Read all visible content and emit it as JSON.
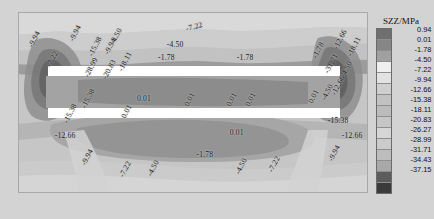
{
  "figure": {
    "type": "contour",
    "quantity": "SZZ",
    "units": "MPa",
    "legend_title": "SZZ/MPa"
  },
  "legend": {
    "title": "SZZ/MPa",
    "levels": [
      {
        "value": "0.94",
        "color": "#6f6f6f"
      },
      {
        "value": "0.01",
        "color": "#868686"
      },
      {
        "value": "-1.78",
        "color": "#a0a0a0"
      },
      {
        "value": "-4.50",
        "color": "#efefef"
      },
      {
        "value": "-7.22",
        "color": "#e2e2e2"
      },
      {
        "value": "-9.94",
        "color": "#cfcfcf"
      },
      {
        "value": "-12.66",
        "color": "#c2c2c2"
      },
      {
        "value": "-15.38",
        "color": "#bcbcbc"
      },
      {
        "value": "-18.11",
        "color": "#c6c6c6"
      },
      {
        "value": "-20.83",
        "color": "#d6d6d6"
      },
      {
        "value": "-26.27",
        "color": "#cbcbcb"
      },
      {
        "value": "-28.99",
        "color": "#bdbdbd"
      },
      {
        "value": "-31.71",
        "color": "#a8a8a8"
      },
      {
        "value": "-34.43",
        "color": "#5c5c5c"
      },
      {
        "value": "-37.15",
        "color": "#3a3a3a"
      }
    ]
  },
  "chart_data": {
    "type": "heatmap",
    "title": "SZZ/MPa",
    "xlabel": "",
    "ylabel": "",
    "grid": false,
    "legend_position": "right",
    "colorbar_levels": [
      0.94,
      0.01,
      -1.78,
      -4.5,
      -7.22,
      -9.94,
      -12.66,
      -15.38,
      -18.11,
      -20.83,
      -26.27,
      -28.99,
      -31.71,
      -34.43,
      -37.15
    ],
    "contour_labels": [
      {
        "text": "-9.94",
        "x": 0.035,
        "y": 0.165,
        "rot": -62
      },
      {
        "text": "-7.22",
        "x": 0.085,
        "y": 0.275,
        "rot": -62
      },
      {
        "text": "-15.38",
        "x": 0.135,
        "y": 0.585,
        "rot": -62
      },
      {
        "text": "-15.38",
        "x": 0.185,
        "y": 0.505,
        "rot": -62
      },
      {
        "text": "-12.66",
        "x": 0.105,
        "y": 0.655,
        "rot": 0
      },
      {
        "text": "-9.94",
        "x": 0.185,
        "y": 0.815,
        "rot": -62
      },
      {
        "text": "-7.22",
        "x": 0.295,
        "y": 0.885,
        "rot": -62
      },
      {
        "text": "-4.50",
        "x": 0.375,
        "y": 0.88,
        "rot": -62
      },
      {
        "text": "-9.94",
        "x": 0.15,
        "y": 0.135,
        "rot": -62
      },
      {
        "text": "-15.38",
        "x": 0.205,
        "y": 0.215,
        "rot": -62
      },
      {
        "text": "-4.50",
        "x": 0.268,
        "y": 0.15,
        "rot": -62
      },
      {
        "text": "-9.94",
        "x": 0.25,
        "y": 0.205,
        "rot": -62
      },
      {
        "text": "-28.99",
        "x": 0.195,
        "y": 0.33,
        "rot": -62
      },
      {
        "text": "-20.83",
        "x": 0.245,
        "y": 0.345,
        "rot": -62
      },
      {
        "text": "-18.11",
        "x": 0.29,
        "y": 0.3,
        "rot": -62
      },
      {
        "text": "-7.22",
        "x": 0.48,
        "y": 0.065,
        "rot": -14
      },
      {
        "text": "-4.50",
        "x": 0.425,
        "y": 0.155,
        "rot": 0
      },
      {
        "text": "-1.78",
        "x": 0.4,
        "y": 0.225,
        "rot": 0
      },
      {
        "text": "-1.78",
        "x": 0.625,
        "y": 0.225,
        "rot": 0
      },
      {
        "text": "-1.78",
        "x": 0.845,
        "y": 0.225,
        "rot": -62
      },
      {
        "text": "0.01",
        "x": 0.34,
        "y": 0.455,
        "rot": 0
      },
      {
        "text": "0.01",
        "x": 0.48,
        "y": 0.49,
        "rot": -62
      },
      {
        "text": "0.01",
        "x": 0.6,
        "y": 0.49,
        "rot": -62
      },
      {
        "text": "0.01",
        "x": 0.655,
        "y": 0.49,
        "rot": -62
      },
      {
        "text": "0.01",
        "x": 0.3,
        "y": 0.56,
        "rot": -62
      },
      {
        "text": "0.01",
        "x": 0.605,
        "y": 0.64,
        "rot": 0
      },
      {
        "text": "-1.78",
        "x": 0.51,
        "y": 0.76,
        "rot": 0
      },
      {
        "text": "-12.66",
        "x": 0.905,
        "y": 0.175,
        "rot": -62
      },
      {
        "text": "-18.11",
        "x": 0.945,
        "y": 0.215,
        "rot": -62
      },
      {
        "text": "-31.71",
        "x": 0.88,
        "y": 0.31,
        "rot": -62
      },
      {
        "text": "-4.50",
        "x": 0.925,
        "y": 0.33,
        "rot": -62
      },
      {
        "text": "-12.66",
        "x": 0.9,
        "y": 0.43,
        "rot": -62
      },
      {
        "text": "0.01",
        "x": 0.835,
        "y": 0.475,
        "rot": -62
      },
      {
        "text": "-4.50",
        "x": 0.87,
        "y": 0.46,
        "rot": -62
      },
      {
        "text": "-15.38",
        "x": 0.885,
        "y": 0.575,
        "rot": 0
      },
      {
        "text": "-12.66",
        "x": 0.925,
        "y": 0.66,
        "rot": 0
      },
      {
        "text": "-9.94",
        "x": 0.89,
        "y": 0.795,
        "rot": -62
      },
      {
        "text": "-7.22",
        "x": 0.72,
        "y": 0.855,
        "rot": -62
      },
      {
        "text": "-4.50",
        "x": 0.625,
        "y": 0.865,
        "rot": -62
      }
    ],
    "openings": [
      {
        "name": "upper-opening",
        "x0": 0.085,
        "x1": 0.925,
        "y0": 0.3,
        "y1": 0.355
      },
      {
        "name": "lower-opening",
        "x0": 0.085,
        "x1": 0.925,
        "y0": 0.53,
        "y1": 0.585
      }
    ]
  }
}
